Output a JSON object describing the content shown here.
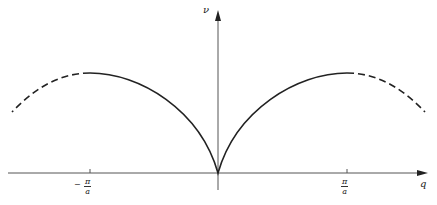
{
  "diagram": {
    "y_axis_label": "ν",
    "x_axis_label": "q",
    "ticks": [
      {
        "position": "left",
        "sign": "−",
        "numerator": "π",
        "denominator": "a"
      },
      {
        "position": "right",
        "sign": "",
        "numerator": "π",
        "denominator": "a"
      }
    ],
    "curve": {
      "solid_range": "−π/a to π/a",
      "dashed_range": "beyond ±π/a",
      "color": "#222222"
    }
  }
}
